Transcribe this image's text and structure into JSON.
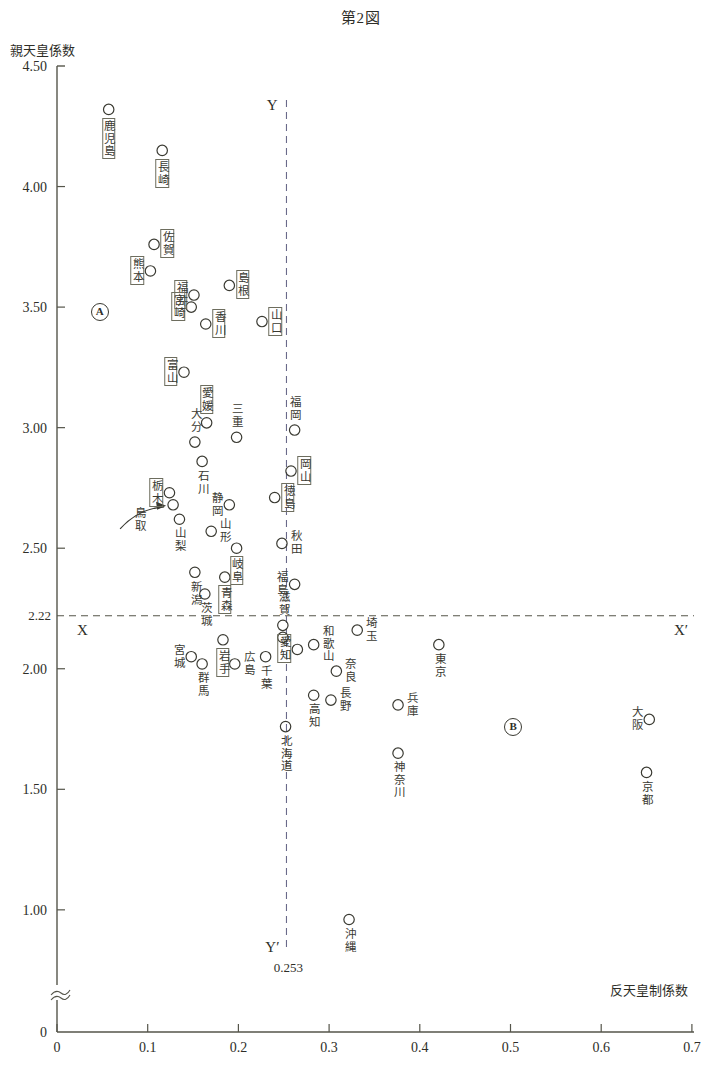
{
  "title": "第2図",
  "axes": {
    "ylabel": "親天皇係数",
    "xlabel": "反天皇制係数",
    "yticks": [
      "4.50",
      "4.00",
      "3.50",
      "3.00",
      "2.50",
      "2.00",
      "1.50",
      "1.00",
      "0"
    ],
    "xticks": [
      "0",
      "0.1",
      "0.2",
      "0.3",
      "0.4",
      "0.5",
      "0.6",
      "0.7"
    ],
    "x_origin_label": "0",
    "threshold_y_label": "2.22",
    "threshold_x_label": "0.253",
    "line_x_left": "X",
    "line_x_right": "X′",
    "line_y_top": "Y",
    "line_y_bottom": "Y′",
    "marker_a": "Ⓐ",
    "marker_b": "Ⓑ",
    "marker_a_text": "A",
    "marker_b_text": "B"
  },
  "chart_data": {
    "type": "scatter",
    "title": "第2図",
    "xlabel": "反天皇制係数",
    "ylabel": "親天皇係数",
    "xlim": [
      0,
      0.7
    ],
    "ylim": [
      0,
      4.5
    ],
    "y_axis_break": true,
    "grid": false,
    "legend": "none",
    "reference_lines": [
      {
        "axis": "y",
        "value": 2.22,
        "label_left": "X",
        "label_right": "X′",
        "style": "dashed"
      },
      {
        "axis": "x",
        "value": 0.253,
        "label_top": "Y",
        "label_bottom": "Y′",
        "style": "dashed"
      }
    ],
    "annotations": [
      {
        "name": "marker-a",
        "text": "A",
        "x": 0.047,
        "y": 3.48
      },
      {
        "name": "marker-b",
        "text": "B",
        "x": 0.503,
        "y": 1.76
      },
      {
        "name": "arrow-tottori",
        "from_label": "鳥取",
        "points_to": {
          "x": 0.128,
          "y": 2.68
        }
      }
    ],
    "points": [
      {
        "label": "鹿児島",
        "x": 0.057,
        "y": 4.32,
        "boxed": true,
        "label_pos": "below"
      },
      {
        "label": "長崎",
        "x": 0.116,
        "y": 4.15,
        "boxed": true,
        "label_pos": "below"
      },
      {
        "label": "佐賀",
        "x": 0.107,
        "y": 3.76,
        "boxed": true,
        "label_pos": "right"
      },
      {
        "label": "熊本",
        "x": 0.103,
        "y": 3.65,
        "boxed": true,
        "label_pos": "left"
      },
      {
        "label": "島根",
        "x": 0.19,
        "y": 3.59,
        "boxed": true,
        "label_pos": "right"
      },
      {
        "label": "福井",
        "x": 0.151,
        "y": 3.55,
        "boxed": true,
        "label_pos": "left"
      },
      {
        "label": "宮崎",
        "x": 0.148,
        "y": 3.5,
        "boxed": true,
        "label_pos": "left"
      },
      {
        "label": "香川",
        "x": 0.164,
        "y": 3.43,
        "boxed": true,
        "label_pos": "right"
      },
      {
        "label": "山口",
        "x": 0.226,
        "y": 3.44,
        "boxed": true,
        "label_pos": "right"
      },
      {
        "label": "富山",
        "x": 0.14,
        "y": 3.23,
        "boxed": true,
        "label_pos": "left"
      },
      {
        "label": "愛媛",
        "x": 0.165,
        "y": 3.02,
        "boxed": true,
        "label_pos": "above"
      },
      {
        "label": "福岡",
        "x": 0.262,
        "y": 2.99,
        "boxed": false,
        "label_pos": "above"
      },
      {
        "label": "三重",
        "x": 0.198,
        "y": 2.96,
        "boxed": false,
        "label_pos": "above"
      },
      {
        "label": "大分",
        "x": 0.152,
        "y": 2.94,
        "boxed": false,
        "label_pos": "above"
      },
      {
        "label": "岡山",
        "x": 0.258,
        "y": 2.82,
        "boxed": true,
        "label_pos": "right"
      },
      {
        "label": "石川",
        "x": 0.16,
        "y": 2.86,
        "boxed": false,
        "label_pos": "below"
      },
      {
        "label": "栃木",
        "x": 0.124,
        "y": 2.73,
        "boxed": true,
        "label_pos": "left"
      },
      {
        "label": "徳島",
        "x": 0.24,
        "y": 2.71,
        "boxed": true,
        "label_pos": "right"
      },
      {
        "label": "静岡",
        "x": 0.19,
        "y": 2.68,
        "boxed": false,
        "label_pos": "left"
      },
      {
        "label": "鳥取",
        "x": 0.128,
        "y": 2.68,
        "boxed": false,
        "label_pos": "arrow"
      },
      {
        "label": "山梨",
        "x": 0.135,
        "y": 2.62,
        "boxed": false,
        "label_pos": "below"
      },
      {
        "label": "山形",
        "x": 0.17,
        "y": 2.57,
        "boxed": false,
        "label_pos": "right"
      },
      {
        "label": "岐阜",
        "x": 0.198,
        "y": 2.5,
        "boxed": true,
        "label_pos": "below"
      },
      {
        "label": "秋田",
        "x": 0.248,
        "y": 2.52,
        "boxed": false,
        "label_pos": "right"
      },
      {
        "label": "新潟",
        "x": 0.152,
        "y": 2.4,
        "boxed": false,
        "label_pos": "below"
      },
      {
        "label": "青森",
        "x": 0.185,
        "y": 2.38,
        "boxed": true,
        "label_pos": "below"
      },
      {
        "label": "福島",
        "x": 0.262,
        "y": 2.35,
        "boxed": false,
        "label_pos": "left"
      },
      {
        "label": "茨城",
        "x": 0.163,
        "y": 2.31,
        "boxed": false,
        "label_pos": "below"
      },
      {
        "label": "滋賀",
        "x": 0.249,
        "y": 2.18,
        "boxed": false,
        "label_pos": "above"
      },
      {
        "label": "滋賀2",
        "x": 0.249,
        "y": 2.13,
        "boxed": false,
        "label_pos": "none"
      },
      {
        "label": "愛知",
        "x": 0.265,
        "y": 2.08,
        "boxed": true,
        "label_pos": "left"
      },
      {
        "label": "和歌山",
        "x": 0.283,
        "y": 2.1,
        "boxed": false,
        "label_pos": "right"
      },
      {
        "label": "埼玉",
        "x": 0.331,
        "y": 2.16,
        "boxed": false,
        "label_pos": "right"
      },
      {
        "label": "東京",
        "x": 0.421,
        "y": 2.1,
        "boxed": false,
        "label_pos": "below"
      },
      {
        "label": "奈良",
        "x": 0.308,
        "y": 1.99,
        "boxed": false,
        "label_pos": "right"
      },
      {
        "label": "岩手",
        "x": 0.183,
        "y": 2.12,
        "boxed": true,
        "label_pos": "below"
      },
      {
        "label": "宮城",
        "x": 0.148,
        "y": 2.05,
        "boxed": false,
        "label_pos": "left"
      },
      {
        "label": "群馬",
        "x": 0.16,
        "y": 2.02,
        "boxed": false,
        "label_pos": "below"
      },
      {
        "label": "広島",
        "x": 0.196,
        "y": 2.02,
        "boxed": false,
        "label_pos": "right"
      },
      {
        "label": "千葉",
        "x": 0.23,
        "y": 2.05,
        "boxed": false,
        "label_pos": "below"
      },
      {
        "label": "高知",
        "x": 0.283,
        "y": 1.89,
        "boxed": false,
        "label_pos": "below"
      },
      {
        "label": "長野",
        "x": 0.302,
        "y": 1.87,
        "boxed": false,
        "label_pos": "right"
      },
      {
        "label": "兵庫",
        "x": 0.376,
        "y": 1.85,
        "boxed": false,
        "label_pos": "right"
      },
      {
        "label": "大阪",
        "x": 0.653,
        "y": 1.79,
        "boxed": false,
        "label_pos": "left"
      },
      {
        "label": "北海道",
        "x": 0.252,
        "y": 1.76,
        "boxed": false,
        "label_pos": "below"
      },
      {
        "label": "神奈川",
        "x": 0.376,
        "y": 1.65,
        "boxed": false,
        "label_pos": "below"
      },
      {
        "label": "京都",
        "x": 0.65,
        "y": 1.57,
        "boxed": false,
        "label_pos": "below"
      },
      {
        "label": "沖縄",
        "x": 0.322,
        "y": 0.96,
        "boxed": false,
        "label_pos": "below"
      }
    ]
  },
  "labels": {
    "kagoshima": "鹿児島",
    "nagasaki": "長崎",
    "saga": "佐賀",
    "kumamoto": "熊本",
    "shimane": "島根",
    "fukui": "福井",
    "miyazaki": "宮崎",
    "kagawa": "香川",
    "yamaguchi": "山口",
    "toyama": "富山",
    "ehime": "愛媛",
    "fukuoka": "福岡",
    "mie": "三重",
    "oita": "大分",
    "okayama": "岡山",
    "ishikawa": "石川",
    "tochigi": "栃木",
    "tokushima": "徳島",
    "shizuoka": "静岡",
    "tottori": "鳥取",
    "yamanashi": "山梨",
    "yamagata": "山形",
    "gifu": "岐阜",
    "akita": "秋田",
    "niigata": "新潟",
    "aomori": "青森",
    "fukushima": "福島",
    "ibaraki": "茨城",
    "shiga": "滋賀",
    "aichi": "愛知",
    "wakayama": "和歌山",
    "saitama": "埼玉",
    "tokyo": "東京",
    "nara": "奈良",
    "iwate": "岩手",
    "miyagi": "宮城",
    "gunma": "群馬",
    "hiroshima": "広島",
    "chiba": "千葉",
    "kochi": "高知",
    "nagano": "長野",
    "hyogo": "兵庫",
    "osaka": "大阪",
    "hokkaido": "北海道",
    "kanagawa": "神奈川",
    "kyoto": "京都",
    "okinawa": "沖縄"
  }
}
